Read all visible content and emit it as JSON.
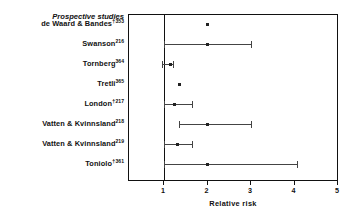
{
  "chart_data": {
    "type": "scatter",
    "orientation": "horizontal",
    "title": "",
    "group_heading": "Prospective studies",
    "xlabel": "Relative risk",
    "ylabel": "",
    "xlim": [
      1,
      5
    ],
    "xticks": [
      1,
      2,
      3,
      4,
      5
    ],
    "xtick_labels": [
      "1",
      "2",
      "3",
      "4",
      "5"
    ],
    "grid": false,
    "legend": null,
    "reference_line": 1,
    "categories": [
      "de Waard & Bandes",
      "Swanson",
      "Tornberg",
      "Tretli",
      "London",
      "Vatten & Kvinnsland",
      "Vatten & Kvinnsland",
      "Toniolo"
    ],
    "rows": [
      {
        "label": "de Waard & Bandes",
        "dagger": "†",
        "reference": "353",
        "point": 2.0,
        "ci_low": null,
        "ci_high": null
      },
      {
        "label": "Swanson",
        "dagger": "",
        "reference": "216",
        "point": 2.0,
        "ci_low": 1.0,
        "ci_high": 3.0
      },
      {
        "label": "Tornberg",
        "dagger": "",
        "reference": "364",
        "point": 1.15,
        "ci_low": 0.95,
        "ci_high": 1.2
      },
      {
        "label": "Tretli",
        "dagger": "",
        "reference": "365",
        "point": 1.35,
        "ci_low": null,
        "ci_high": null
      },
      {
        "label": "London",
        "dagger": "†",
        "reference": "217",
        "point": 1.25,
        "ci_low": 1.0,
        "ci_high": 1.65
      },
      {
        "label": "Vatten & Kvinnsland",
        "dagger": "",
        "reference": "218",
        "point": 2.0,
        "ci_low": 1.35,
        "ci_high": 3.0
      },
      {
        "label": "Vatten & Kvinnsland",
        "dagger": "",
        "reference": "219",
        "point": 1.3,
        "ci_low": 1.0,
        "ci_high": 1.65
      },
      {
        "label": "Toniolo",
        "dagger": "†",
        "reference": "361",
        "point": 2.0,
        "ci_low": 1.0,
        "ci_high": 4.05
      }
    ]
  }
}
